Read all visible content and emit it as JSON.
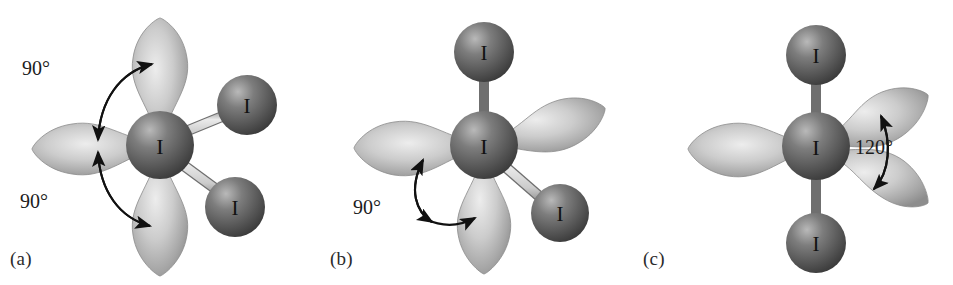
{
  "figure": {
    "background_color": "#ffffff",
    "width": 953,
    "height": 285,
    "colors": {
      "sphere_dark": "#4a4a4a",
      "sphere_mid": "#6e6e6e",
      "sphere_highlight": "#c9c9c9",
      "lobe_light": "#e3e3e3",
      "lobe_mid": "#b4b4b4",
      "lobe_dark": "#8a8a8a",
      "bond_fill": "#d2d2d2",
      "bond_stroke": "#707070",
      "arrow": "#111111",
      "text": "#1c1c1c",
      "atom_label": "#111111"
    }
  },
  "panels": [
    {
      "id": "a",
      "label": "(a)",
      "center_atom": {
        "symbol": "I",
        "name": "central-iodine-atom"
      },
      "lobes": [
        {
          "name": "lone-pair-lobe-up",
          "direction": "up"
        },
        {
          "name": "lone-pair-lobe-left",
          "direction": "left"
        },
        {
          "name": "lone-pair-lobe-down",
          "direction": "down"
        }
      ],
      "bonded_atoms": [
        {
          "symbol": "I",
          "name": "bonded-iodine-upper-right",
          "direction": "upper-right"
        },
        {
          "symbol": "I",
          "name": "bonded-iodine-lower-right",
          "direction": "lower-right"
        }
      ],
      "angles": [
        {
          "name": "angle-label-upper",
          "value": "90°"
        },
        {
          "name": "angle-label-lower",
          "value": "90°"
        }
      ]
    },
    {
      "id": "b",
      "label": "(b)",
      "center_atom": {
        "symbol": "I",
        "name": "central-iodine-atom"
      },
      "lobes": [
        {
          "name": "lone-pair-lobe-left",
          "direction": "left"
        },
        {
          "name": "lone-pair-lobe-upper-right",
          "direction": "upper-right"
        },
        {
          "name": "lone-pair-lobe-down",
          "direction": "down"
        }
      ],
      "bonded_atoms": [
        {
          "symbol": "I",
          "name": "bonded-iodine-top",
          "direction": "up"
        },
        {
          "symbol": "I",
          "name": "bonded-iodine-lower-right",
          "direction": "lower-right"
        }
      ],
      "angles": [
        {
          "name": "angle-label-main",
          "value": "90°"
        }
      ]
    },
    {
      "id": "c",
      "label": "(c)",
      "center_atom": {
        "symbol": "I",
        "name": "central-iodine-atom"
      },
      "lobes": [
        {
          "name": "lone-pair-lobe-left",
          "direction": "left"
        },
        {
          "name": "lone-pair-lobe-upper-right",
          "direction": "upper-right"
        },
        {
          "name": "lone-pair-lobe-lower-right",
          "direction": "lower-right"
        }
      ],
      "bonded_atoms": [
        {
          "symbol": "I",
          "name": "bonded-iodine-top",
          "direction": "up"
        },
        {
          "symbol": "I",
          "name": "bonded-iodine-bottom",
          "direction": "down"
        }
      ],
      "angles": [
        {
          "name": "angle-label-main",
          "value": "120°"
        }
      ]
    }
  ]
}
